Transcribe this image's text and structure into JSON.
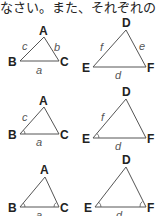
{
  "header": {
    "text": "なさい。また、それぞれの"
  },
  "figures": [
    {
      "row": 1,
      "left": {
        "vertices": [
          "A",
          "B",
          "C"
        ],
        "sides": [
          "a",
          "b",
          "c"
        ],
        "angle_marks": []
      },
      "right": {
        "vertices": [
          "D",
          "E",
          "F"
        ],
        "sides": [
          "d",
          "e",
          "f"
        ],
        "angle_marks": []
      }
    },
    {
      "row": 2,
      "left": {
        "vertices": [
          "A",
          "B",
          "C"
        ],
        "sides": [
          "a",
          "c"
        ],
        "angle_marks": [
          "B"
        ]
      },
      "right": {
        "vertices": [
          "D",
          "E",
          "F"
        ],
        "sides": [
          "d",
          "f"
        ],
        "angle_marks": [
          "E"
        ]
      }
    },
    {
      "row": 3,
      "left": {
        "vertices": [
          "A",
          "B",
          "C"
        ],
        "sides": [
          "a"
        ],
        "angle_marks": [
          "B",
          "C"
        ]
      },
      "right": {
        "vertices": [
          "D",
          "E",
          "F"
        ],
        "sides": [
          "d"
        ],
        "angle_marks": [
          "E",
          "F"
        ]
      }
    }
  ],
  "labels": {
    "r1": {
      "A": "A",
      "B": "B",
      "C": "C",
      "a": "a",
      "b": "b",
      "c": "c",
      "D": "D",
      "E": "E",
      "F": "F",
      "d": "d",
      "e": "e",
      "f": "f"
    },
    "r2": {
      "A": "A",
      "B": "B",
      "C": "C",
      "a": "a",
      "c": "c",
      "D": "D",
      "E": "E",
      "F": "F",
      "d": "d",
      "f": "f"
    },
    "r3": {
      "A": "A",
      "B": "B",
      "C": "C",
      "a": "a",
      "D": "D",
      "E": "E",
      "F": "F",
      "d": "d"
    }
  },
  "colors": {
    "line": "#555555",
    "text": "#222222",
    "side_label": "#555555"
  }
}
